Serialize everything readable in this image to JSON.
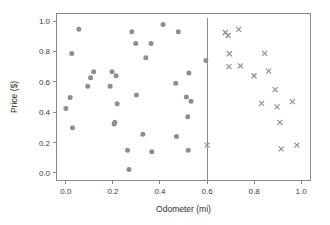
{
  "figure": {
    "background_color": "#ffffff",
    "frame_color": "#888888",
    "marker_color": "#8e8e8e"
  },
  "axes": {
    "x_title": "Odometer (mi)",
    "y_title": "Price ($)",
    "x_ticks": [
      "0.0",
      "0.2",
      "0.4",
      "0.6",
      "0.8",
      "1.0"
    ],
    "y_ticks": [
      "0.0",
      "0.2",
      "0.4",
      "0.6",
      "0.8",
      "1.0"
    ]
  },
  "annotations": {
    "vertical_line_label": "threshold-line",
    "vertical_line_x": 0.6
  },
  "chart_data": {
    "type": "scatter",
    "title": "",
    "xlabel": "Odometer (mi)",
    "ylabel": "Price ($)",
    "xlim": [
      -0.04,
      1.04
    ],
    "ylim": [
      -0.05,
      1.05
    ],
    "grid": false,
    "legend": false,
    "annotations": [
      {
        "type": "vline",
        "x": 0.6,
        "color": "#8a8a8a"
      }
    ],
    "series": [
      {
        "name": "observed",
        "marker": "circle",
        "color": "#8e8e8e",
        "points": [
          [
            0.0,
            0.425
          ],
          [
            0.018,
            0.497
          ],
          [
            0.025,
            0.787
          ],
          [
            0.028,
            0.298
          ],
          [
            0.055,
            0.947
          ],
          [
            0.093,
            0.57
          ],
          [
            0.105,
            0.627
          ],
          [
            0.118,
            0.667
          ],
          [
            0.188,
            0.57
          ],
          [
            0.196,
            0.667
          ],
          [
            0.205,
            0.322
          ],
          [
            0.208,
            0.333
          ],
          [
            0.213,
            0.64
          ],
          [
            0.218,
            0.455
          ],
          [
            0.262,
            0.15
          ],
          [
            0.268,
            0.023
          ],
          [
            0.28,
            0.93
          ],
          [
            0.297,
            0.852
          ],
          [
            0.3,
            0.513
          ],
          [
            0.327,
            0.255
          ],
          [
            0.34,
            0.758
          ],
          [
            0.362,
            0.852
          ],
          [
            0.365,
            0.14
          ],
          [
            0.413,
            0.977
          ],
          [
            0.467,
            0.59
          ],
          [
            0.47,
            0.24
          ],
          [
            0.478,
            0.93
          ],
          [
            0.512,
            0.5
          ],
          [
            0.518,
            0.37
          ],
          [
            0.52,
            0.15
          ],
          [
            0.523,
            0.658
          ],
          [
            0.532,
            0.472
          ],
          [
            0.595,
            0.74
          ]
        ]
      },
      {
        "name": "counterfactual",
        "marker": "x",
        "color": "#8e8e8e",
        "points": [
          [
            0.6,
            0.183
          ],
          [
            0.678,
            0.925
          ],
          [
            0.69,
            0.905
          ],
          [
            0.693,
            0.7
          ],
          [
            0.695,
            0.785
          ],
          [
            0.735,
            0.945
          ],
          [
            0.742,
            0.705
          ],
          [
            0.8,
            0.64
          ],
          [
            0.832,
            0.458
          ],
          [
            0.845,
            0.787
          ],
          [
            0.862,
            0.67
          ],
          [
            0.89,
            0.548
          ],
          [
            0.898,
            0.435
          ],
          [
            0.91,
            0.333
          ],
          [
            0.915,
            0.158
          ],
          [
            0.963,
            0.47
          ],
          [
            0.982,
            0.183
          ]
        ]
      }
    ]
  }
}
